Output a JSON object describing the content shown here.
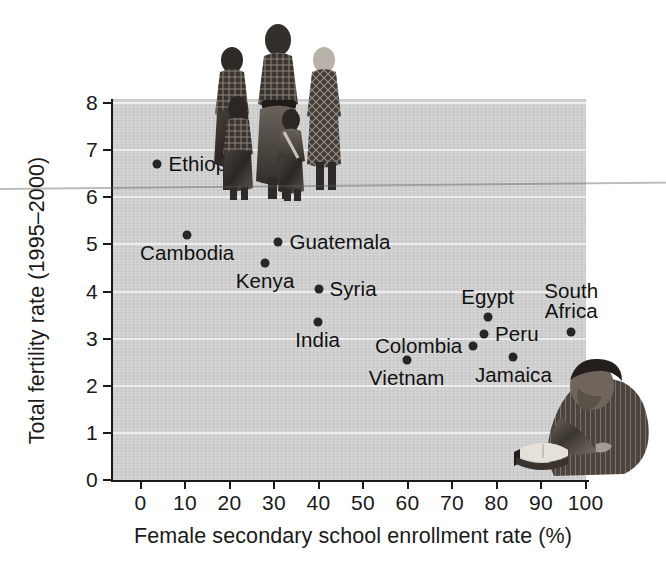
{
  "chart_data": {
    "type": "scatter",
    "title": "",
    "xlabel": "Female secondary school enrollment rate (%)",
    "ylabel": "Total fertility rate (1995–2000)",
    "xlim": [
      0,
      100
    ],
    "ylim": [
      0,
      8
    ],
    "xticks": [
      "0",
      "10",
      "20",
      "30",
      "40",
      "50",
      "60",
      "70",
      "80",
      "90",
      "100"
    ],
    "yticks": [
      "0",
      "1",
      "2",
      "3",
      "4",
      "5",
      "6",
      "7",
      "8"
    ],
    "grid": "horizontal-white-gridlines",
    "legend": "none",
    "plot_background": "#cfcfcf",
    "point_color": "#262626",
    "points": [
      {
        "label": "Ethiopia",
        "x": 3.8,
        "y": 6.7,
        "label_pos": "right"
      },
      {
        "label": "Cambodia",
        "x": 10.5,
        "y": 5.2,
        "label_pos": "below"
      },
      {
        "label": "Guatemala",
        "x": 31.0,
        "y": 5.05,
        "label_pos": "right"
      },
      {
        "label": "Kenya",
        "x": 28.0,
        "y": 4.6,
        "label_pos": "below"
      },
      {
        "label": "Syria",
        "x": 40.0,
        "y": 4.05,
        "label_pos": "right"
      },
      {
        "label": "India",
        "x": 39.8,
        "y": 3.35,
        "label_pos": "below"
      },
      {
        "label": "Egypt",
        "x": 78.0,
        "y": 3.45,
        "label_pos": "above"
      },
      {
        "label": "South\nAfrica",
        "x": 96.8,
        "y": 3.15,
        "label_pos": "above"
      },
      {
        "label": "Peru",
        "x": 77.2,
        "y": 3.1,
        "label_pos": "right"
      },
      {
        "label": "Colombia",
        "x": 74.8,
        "y": 2.85,
        "label_pos": "left"
      },
      {
        "label": "Jamaica",
        "x": 83.8,
        "y": 2.6,
        "label_pos": "below"
      },
      {
        "label": "Vietnam",
        "x": 59.8,
        "y": 2.55,
        "label_pos": "below"
      }
    ],
    "images": [
      {
        "name": "family-photo",
        "caption": "Mother with four children standing, grayscale photograph"
      },
      {
        "name": "reader-photo",
        "caption": "Woman reading an open book, grayscale photograph"
      }
    ]
  }
}
